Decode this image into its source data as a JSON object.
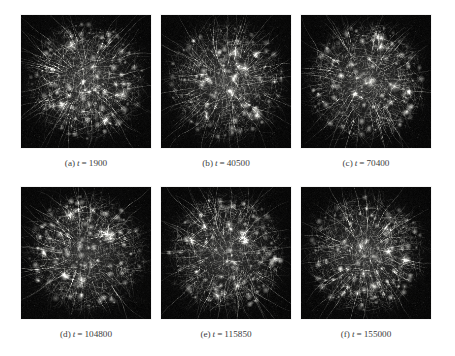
{
  "figure": {
    "background_color": "#ffffff",
    "panel_background_color": "#050505",
    "caption_color": "#3c3c3c",
    "filament_color": "#c8c8c4",
    "rows": 2,
    "columns": 3
  },
  "panels": [
    {
      "id": "panel-a",
      "caption_label": "(a)",
      "caption_variable": "t",
      "caption_equals": "=",
      "caption_value": "1900",
      "caption_full": "(a) t = 1900",
      "seed": 1900
    },
    {
      "id": "panel-b",
      "caption_label": "(b)",
      "caption_variable": "t",
      "caption_equals": "=",
      "caption_value": "40500",
      "caption_full": "(b) t = 40500",
      "seed": 40500
    },
    {
      "id": "panel-c",
      "caption_label": "(c)",
      "caption_variable": "t",
      "caption_equals": "=",
      "caption_value": "70400",
      "caption_full": "(c) t = 70400",
      "seed": 70400
    },
    {
      "id": "panel-d",
      "caption_label": "(d)",
      "caption_variable": "t",
      "caption_equals": "=",
      "caption_value": "104800",
      "caption_full": "(d) t = 104800",
      "seed": 104800
    },
    {
      "id": "panel-e",
      "caption_label": "(e)",
      "caption_variable": "t",
      "caption_equals": "=",
      "caption_value": "115850",
      "caption_full": "(e) t = 115850",
      "seed": 115850
    },
    {
      "id": "panel-f",
      "caption_label": "(f)",
      "caption_variable": "t",
      "caption_equals": "=",
      "caption_value": "155000",
      "caption_full": "(f) t = 155000",
      "seed": 155000
    }
  ]
}
